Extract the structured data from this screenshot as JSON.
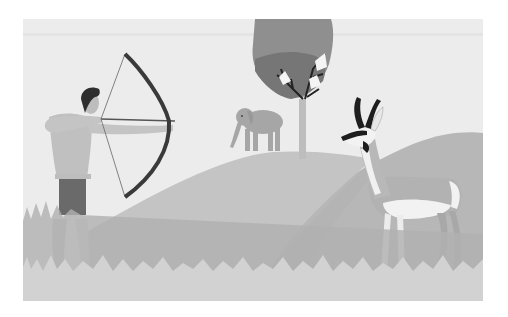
{
  "scene": {
    "description": "Grayscale illustration: an archer drawing a bow on the left, an elephant and a tree on a green hill in the middle, and a pronghorn antelope standing on the right, with grass in the foreground.",
    "subjects": [
      "archer",
      "bow",
      "elephant",
      "tree",
      "pronghorn-antelope",
      "hills",
      "grass"
    ],
    "colors": {
      "page_bg": "#ffffff",
      "sky": "#ececec",
      "sky_band": "#e2e2e2",
      "hill_back": "#b9b9b9",
      "hill_front": "#c6c6c6",
      "grass_dark": "#b0b0b0",
      "grass_light": "#d2d2d2",
      "tree_canopy": "#8e8e8e",
      "tree_canopy_dark": "#6f6f6f",
      "tree_trunk": "#bdbdbd",
      "elephant": "#a6a6a6",
      "skin": "#c0c0c0",
      "loincloth": "#6a6a6a",
      "hair": "#2e2e2e",
      "bow": "#3a3a3a",
      "antelope_body": "#b2b2b2",
      "antelope_white": "#f2f2f2",
      "antelope_dark": "#1e1e1e"
    }
  }
}
